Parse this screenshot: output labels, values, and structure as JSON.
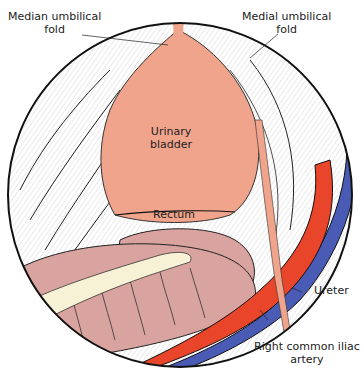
{
  "figure": {
    "type": "anatomical illustration",
    "view": "pelvic cavity viewed from above"
  },
  "labels": {
    "median_umbilical_fold": {
      "line1": "Median umbilical",
      "line2": "fold"
    },
    "medial_umbilical_fold": {
      "line1": "Medial umbilical",
      "line2": "fold"
    },
    "urinary_bladder": {
      "line1": "Urinary",
      "line2": "bladder"
    },
    "rectum": "Rectum",
    "ureter": "Ureter",
    "right_common_iliac_artery": {
      "line1": "Right common iliac",
      "line2": "artery"
    }
  },
  "colors": {
    "bladder": "#f0a48c",
    "rectum": "#d9a3a0",
    "mesentery": "#f7f2d6",
    "artery": "#e8452a",
    "vein": "#4a5bb5",
    "ureter": "#f0a48c",
    "outline": "#111111"
  }
}
